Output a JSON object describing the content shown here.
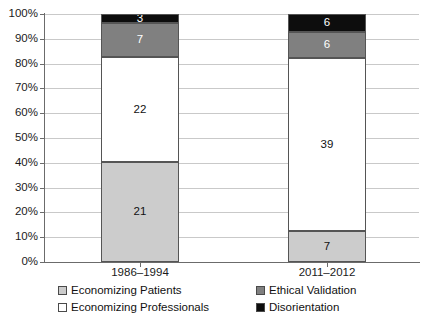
{
  "chart_data": {
    "type": "bar",
    "subtype": "stacked-bar-100-percent",
    "title": "",
    "xlabel": "",
    "ylabel": "",
    "categories": [
      "1986–1994",
      "2011–2012"
    ],
    "series": [
      {
        "name": "Economizing Patients",
        "values": [
          21,
          7
        ],
        "color": "#cccccc"
      },
      {
        "name": "Economizing Professionals",
        "values": [
          22,
          39
        ],
        "color": "#ffffff"
      },
      {
        "name": "Ethical Validation",
        "values": [
          7,
          6
        ],
        "color": "#808080"
      },
      {
        "name": "Disorientation",
        "values": [
          3,
          6
        ],
        "color": "#0d0d0d"
      }
    ],
    "stack_order_bottom_to_top": [
      "Economizing Patients",
      "Economizing Professionals",
      "Ethical Validation",
      "Disorientation"
    ],
    "column_totals": [
      53,
      58
    ],
    "percent_breakdown": {
      "1986–1994": {
        "Economizing Patients": 39.6,
        "Economizing Professionals": 41.5,
        "Ethical Validation": 13.2,
        "Disorientation": 5.7
      },
      "2011–2012": {
        "Economizing Patients": 12.1,
        "Economizing Professionals": 67.2,
        "Ethical Validation": 10.3,
        "Disorientation": 10.3
      }
    },
    "ylim": [
      0,
      100
    ],
    "yticks": [
      "0%",
      "10%",
      "20%",
      "30%",
      "40%",
      "50%",
      "60%",
      "70%",
      "80%",
      "90%",
      "100%"
    ],
    "grid": true,
    "legend_position": "bottom",
    "bar_segments": [
      {
        "category": "1986–1994",
        "segments": [
          {
            "label": "3",
            "series": "Disorientation",
            "bottom_pct": 96.2,
            "top_pct": 100.0,
            "fill": "#0d0d0d",
            "text_color": "#ffffff"
          },
          {
            "label": "7",
            "series": "Ethical Validation",
            "bottom_pct": 82.7,
            "top_pct": 96.2,
            "fill": "#808080",
            "text_color": "#ffffff"
          },
          {
            "label": "22",
            "series": "Economizing Professionals",
            "bottom_pct": 40.4,
            "top_pct": 82.7,
            "fill": "#ffffff",
            "text_color": "#111111"
          },
          {
            "label": "21",
            "series": "Economizing Patients",
            "bottom_pct": 0.0,
            "top_pct": 40.4,
            "fill": "#cccccc",
            "text_color": "#111111"
          }
        ]
      },
      {
        "category": "2011–2012",
        "segments": [
          {
            "label": "6",
            "series": "Disorientation",
            "bottom_pct": 92.9,
            "top_pct": 100.0,
            "fill": "#0d0d0d",
            "text_color": "#ffffff"
          },
          {
            "label": "6",
            "series": "Ethical Validation",
            "bottom_pct": 82.1,
            "top_pct": 92.9,
            "fill": "#808080",
            "text_color": "#ffffff"
          },
          {
            "label": "39",
            "series": "Economizing Professionals",
            "bottom_pct": 12.5,
            "top_pct": 82.1,
            "fill": "#ffffff",
            "text_color": "#111111"
          },
          {
            "label": "7",
            "series": "Economizing Patients",
            "bottom_pct": 0.0,
            "top_pct": 12.5,
            "fill": "#cccccc",
            "text_color": "#111111"
          }
        ]
      }
    ]
  },
  "legend": {
    "items": [
      {
        "label": "Economizing Patients",
        "color": "#cccccc"
      },
      {
        "label": "Economizing Professionals",
        "color": "#ffffff"
      },
      {
        "label": "Ethical Validation",
        "color": "#808080"
      },
      {
        "label": "Disorientation",
        "color": "#0d0d0d"
      }
    ]
  },
  "colors": {
    "axis": "#6b6b6b",
    "gridline": "#c9c9c9",
    "segment_border": "#555555",
    "text": "#1a1a1a",
    "background": "#ffffff"
  }
}
